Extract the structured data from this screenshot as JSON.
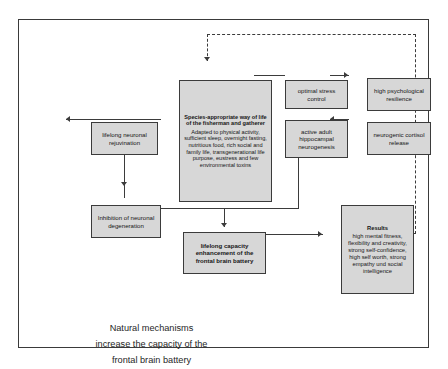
{
  "diagram": {
    "caption": {
      "line1": "Natural mechanisms",
      "line2": "increase the capacity of the",
      "line3": "frontal brain battery"
    },
    "nodes": {
      "species": {
        "title": "Species-appropriate way of life of the fisherman and gatherer",
        "body": "Adapted to physical activity, sufficient sleep, overnight fasting, nutritious food, rich social and family life, transgenerational life purpose, eustress and few environmental toxins"
      },
      "stress_control": {
        "label": "optimal stress control"
      },
      "resilience": {
        "label": "high psychological resilience"
      },
      "cortisol": {
        "label": "neurogenic cortisol release"
      },
      "hippocampal": {
        "label": "active adult hippocampal neurogenesis"
      },
      "rejuvination": {
        "label": "lifelong neuronal rejuvination"
      },
      "inhibition": {
        "label": "Inhibition of neuronal degeneration"
      },
      "capacity": {
        "label": "lifelong capacity enhancement of the frontal brain battery"
      },
      "results": {
        "title": "Results",
        "body": "high mental fitness, flexibility and creativity, strong self-confidence, high self worth, strong empathy und social intelligence"
      }
    },
    "colors": {
      "box_fill": "#d7d7d7",
      "box_border": "#3b3b3b",
      "frame_border": "#3a3a3a",
      "background": "#ffffff"
    }
  }
}
